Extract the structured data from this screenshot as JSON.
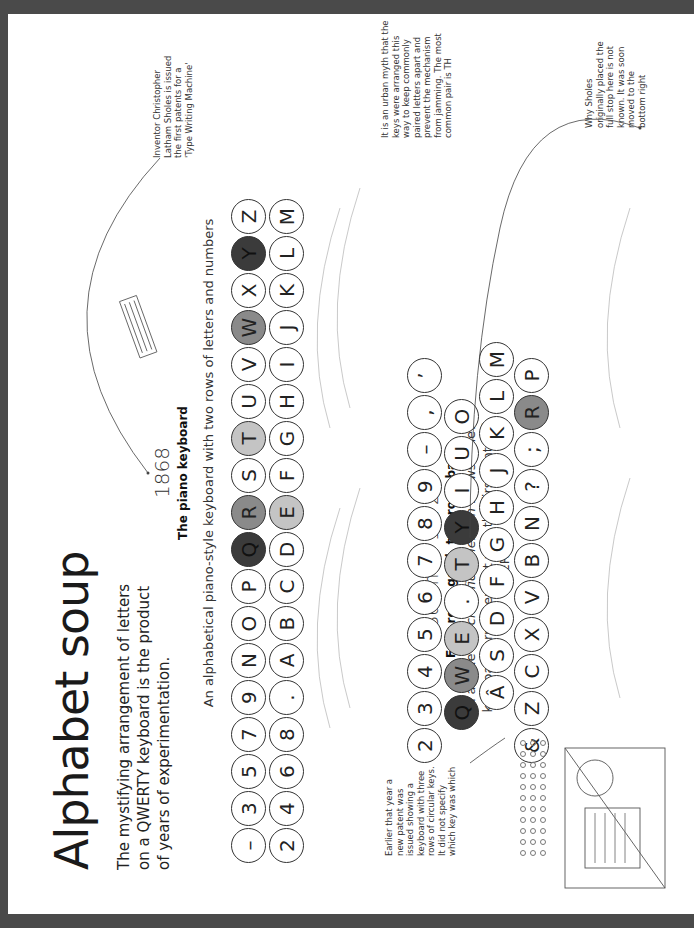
{
  "page": {
    "title": "Alphabet soup",
    "intro": "The mystifying arrangement of letters on a QWERTY keyboard is the product of years of experimentation."
  },
  "section_1868": {
    "year": "1868",
    "heading": "The piano keyboard",
    "caption": "An alphabetical piano-style keyboard with two rows of letters and numbers",
    "row1": [
      {
        "k": "–",
        "s": ""
      },
      {
        "k": "3",
        "s": ""
      },
      {
        "k": "5",
        "s": ""
      },
      {
        "k": "7",
        "s": ""
      },
      {
        "k": "9",
        "s": ""
      },
      {
        "k": "N",
        "s": ""
      },
      {
        "k": "O",
        "s": ""
      },
      {
        "k": "P",
        "s": ""
      },
      {
        "k": "Q",
        "s": "dark"
      },
      {
        "k": "R",
        "s": "mid"
      },
      {
        "k": "S",
        "s": ""
      },
      {
        "k": "T",
        "s": "light"
      },
      {
        "k": "U",
        "s": ""
      },
      {
        "k": "V",
        "s": ""
      },
      {
        "k": "W",
        "s": "mid"
      },
      {
        "k": "X",
        "s": ""
      },
      {
        "k": "Y",
        "s": "dark"
      },
      {
        "k": "Z",
        "s": ""
      }
    ],
    "row2": [
      {
        "k": "2",
        "s": ""
      },
      {
        "k": "4",
        "s": ""
      },
      {
        "k": "6",
        "s": ""
      },
      {
        "k": "8",
        "s": ""
      },
      {
        "k": ".",
        "s": ""
      },
      {
        "k": "A",
        "s": ""
      },
      {
        "k": "B",
        "s": ""
      },
      {
        "k": "C",
        "s": ""
      },
      {
        "k": "D",
        "s": ""
      },
      {
        "k": "E",
        "s": "light"
      },
      {
        "k": "F",
        "s": ""
      },
      {
        "k": "G",
        "s": ""
      },
      {
        "k": "H",
        "s": ""
      },
      {
        "k": "I",
        "s": ""
      },
      {
        "k": "J",
        "s": ""
      },
      {
        "k": "K",
        "s": ""
      },
      {
        "k": "L",
        "s": ""
      },
      {
        "k": "M",
        "s": ""
      }
    ]
  },
  "section_1872": {
    "year": "Summer 1872",
    "heading": "Four rows good, two rows bad",
    "caption_pre": "An article in ",
    "caption_italic": "Scientific American",
    "caption_post": " shows a new keyboard arrangement with the first hints of QWERTY",
    "row1": [
      {
        "k": "2",
        "s": ""
      },
      {
        "k": "3",
        "s": ""
      },
      {
        "k": "4",
        "s": ""
      },
      {
        "k": "5",
        "s": ""
      },
      {
        "k": "6",
        "s": ""
      },
      {
        "k": "7",
        "s": ""
      },
      {
        "k": "8",
        "s": ""
      },
      {
        "k": "9",
        "s": ""
      },
      {
        "k": "–",
        "s": ""
      },
      {
        "k": ",",
        "s": ""
      },
      {
        "k": "’",
        "s": ""
      }
    ],
    "row2": [
      {
        "k": "Q",
        "s": "dark"
      },
      {
        "k": "W",
        "s": "mid"
      },
      {
        "k": "E",
        "s": "light"
      },
      {
        "k": ".",
        "s": ""
      },
      {
        "k": "T",
        "s": "light"
      },
      {
        "k": "Y",
        "s": "dark"
      },
      {
        "k": "I",
        "s": ""
      },
      {
        "k": "U",
        "s": ""
      },
      {
        "k": "O",
        "s": ""
      }
    ],
    "row3": [
      {
        "k": "Â",
        "s": ""
      },
      {
        "k": "S",
        "s": ""
      },
      {
        "k": "D",
        "s": ""
      },
      {
        "k": "F",
        "s": ""
      },
      {
        "k": "G",
        "s": ""
      },
      {
        "k": "H",
        "s": ""
      },
      {
        "k": "J",
        "s": ""
      },
      {
        "k": "K",
        "s": ""
      },
      {
        "k": "L",
        "s": ""
      },
      {
        "k": "M",
        "s": ""
      }
    ],
    "row4": [
      {
        "k": "&",
        "s": ""
      },
      {
        "k": "Z",
        "s": ""
      },
      {
        "k": "C",
        "s": ""
      },
      {
        "k": "X",
        "s": ""
      },
      {
        "k": "V",
        "s": ""
      },
      {
        "k": "B",
        "s": ""
      },
      {
        "k": "N",
        "s": ""
      },
      {
        "k": "?",
        "s": ""
      },
      {
        "k": ";",
        "s": ""
      },
      {
        "k": "R",
        "s": "mid"
      },
      {
        "k": "P",
        "s": ""
      }
    ]
  },
  "notes": {
    "sholes_patent": "Inventor Christopher Latham Sholes is issued the first patents for a 'Type Writing Machine'",
    "urban_myth": "It is an urban myth that the keys were arranged this way to keep commonly paired letters apart and prevent the mechanism from jamming. The most common pair is TH",
    "full_stop": "Why Sholes originally placed the full stop here is not known. It was soon moved to the bottom right",
    "earlier_patent": "Earlier that year a new patent was issued showing a keyboard with three rows of circular keys. It did not specify which key was which"
  },
  "colors": {
    "dark_key": "#3b3b3b",
    "mid_key": "#8a8a8a",
    "light_key": "#c4c4c4",
    "frame": "#4a4a4a"
  }
}
